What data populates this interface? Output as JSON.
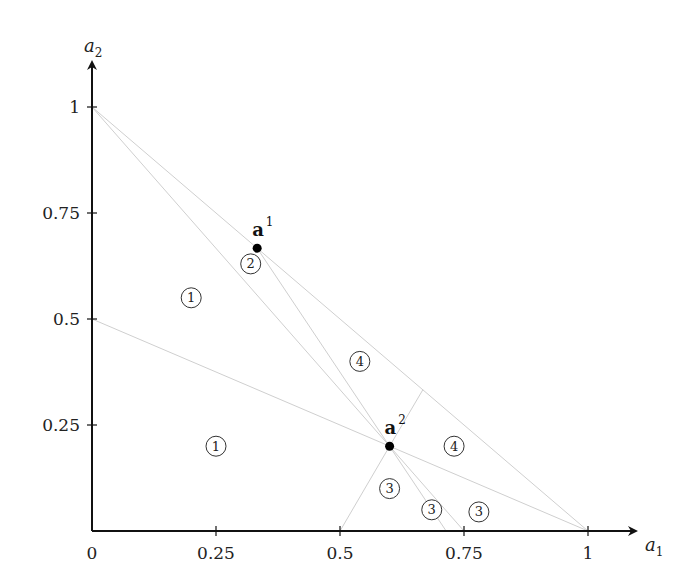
{
  "chart_data": {
    "type": "diagram",
    "title": "",
    "xlabel": "a_1",
    "ylabel": "a_2",
    "axes": {
      "x": {
        "label_main": "a",
        "label_sub": "1",
        "range": [
          0,
          1
        ],
        "ticks": [
          "0",
          "0.25",
          "0.5",
          "0.75",
          "1"
        ]
      },
      "y": {
        "label_main": "a",
        "label_sub": "2",
        "range": [
          0,
          1
        ],
        "ticks": [
          "0.25",
          "0.5",
          "0.75",
          "1"
        ]
      }
    },
    "points": [
      {
        "name": "a1",
        "label_main": "a",
        "label_sup": "1",
        "x": 0.333,
        "y": 0.667
      },
      {
        "name": "a2",
        "label_main": "a",
        "label_sup": "2",
        "x": 0.6,
        "y": 0.2
      }
    ],
    "lines": [
      {
        "from": [
          0,
          1
        ],
        "to": [
          1,
          0
        ]
      },
      {
        "from": [
          0,
          1
        ],
        "to": [
          0.75,
          0
        ]
      },
      {
        "from": [
          0.333,
          0.667
        ],
        "to": [
          0.714,
          0
        ]
      },
      {
        "from": [
          0,
          0.5
        ],
        "to": [
          0.6,
          0.2
        ]
      },
      {
        "from": [
          0.6,
          0.2
        ],
        "to": [
          1,
          0
        ]
      },
      {
        "from": [
          0.6,
          0.2
        ],
        "to": [
          0.5,
          0
        ]
      },
      {
        "from": [
          0.6,
          0.2
        ],
        "to": [
          0.667,
          0.333
        ]
      }
    ],
    "regions": [
      {
        "label": "1",
        "x": 0.2,
        "y": 0.55
      },
      {
        "label": "1",
        "x": 0.25,
        "y": 0.2
      },
      {
        "label": "2",
        "x": 0.32,
        "y": 0.63
      },
      {
        "label": "4",
        "x": 0.54,
        "y": 0.4
      },
      {
        "label": "4",
        "x": 0.73,
        "y": 0.2
      },
      {
        "label": "3",
        "x": 0.6,
        "y": 0.1
      },
      {
        "label": "3",
        "x": 0.685,
        "y": 0.05
      },
      {
        "label": "3",
        "x": 0.78,
        "y": 0.045
      }
    ],
    "grid": false,
    "legend": null
  }
}
